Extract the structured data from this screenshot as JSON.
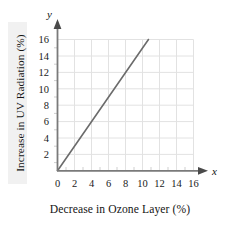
{
  "chart_data": {
    "type": "line",
    "title": "",
    "subtitle": "",
    "xlabel": "Decrease in Ozone Layer (%)",
    "ylabel": "Increase in UV Radiation (%)",
    "x_axis_variable": "x",
    "y_axis_variable": "y",
    "xlim": [
      0,
      16
    ],
    "ylim": [
      0,
      16
    ],
    "xticks": [
      0,
      2,
      4,
      6,
      8,
      10,
      12,
      14,
      16
    ],
    "yticks": [
      2,
      4,
      6,
      8,
      10,
      12,
      14,
      16
    ],
    "xtick_labels": [
      "0",
      "2",
      "4",
      "6",
      "8",
      "10",
      "12",
      "14",
      "16"
    ],
    "ytick_labels": [
      "2",
      "4",
      "6",
      "8",
      "10",
      "12",
      "14",
      "16"
    ],
    "grid": true,
    "grid_spacing": 2,
    "minor_ticks": true,
    "minor_tick_spacing": 1,
    "legend": "none",
    "series": [
      {
        "name": "UV radiation increase",
        "slope": 1.5,
        "intercept": 0,
        "x": [
          0,
          10.7
        ],
        "y": [
          0,
          16
        ],
        "points": [
          {
            "x": 0,
            "y": 0
          },
          {
            "x": 2,
            "y": 3
          },
          {
            "x": 4,
            "y": 6
          },
          {
            "x": 6,
            "y": 9
          },
          {
            "x": 8,
            "y": 12
          },
          {
            "x": 10,
            "y": 15
          },
          {
            "x": 10.7,
            "y": 16
          }
        ]
      }
    ],
    "colors": {
      "line": "#6b6b6b",
      "grid": "#e2e2e2",
      "axis": "#7a7a7a",
      "text": "#141414",
      "background": "#ffffff",
      "label_band": "#f1f1f1"
    }
  }
}
